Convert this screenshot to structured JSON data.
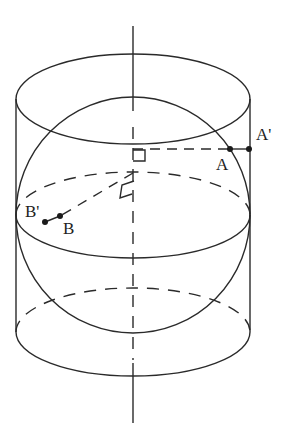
{
  "diagram": {
    "type": "geometry",
    "stroke_color": "#2a2a2a",
    "background": "#ffffff",
    "labels": {
      "A_prime": "A'",
      "A": "A",
      "B_prime": "B'",
      "B": "B"
    },
    "shapes": {
      "cylinder": {
        "cx": 133,
        "left": 16,
        "right": 250,
        "top_cy": 99,
        "bottom_cy": 332,
        "rx": 117,
        "ry": 44
      },
      "sphere": {
        "cx": 133,
        "cy": 215,
        "r": 118
      },
      "equator": {
        "cx": 133,
        "cy": 215,
        "rx": 117,
        "ry": 43
      },
      "axis": {
        "x": 133,
        "y1": 26,
        "y2": 423
      }
    },
    "points": [
      {
        "name": "A",
        "x": 230,
        "y": 149
      },
      {
        "name": "A'",
        "x": 249,
        "y": 149
      },
      {
        "name": "B",
        "x": 60,
        "y": 216
      },
      {
        "name": "B'",
        "x": 45,
        "y": 222
      }
    ]
  }
}
